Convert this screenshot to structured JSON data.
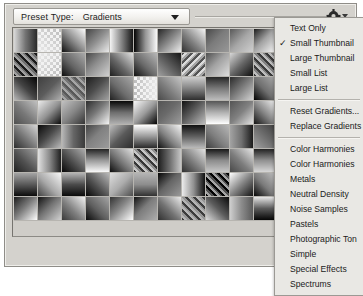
{
  "window": {
    "name": "preset-manager"
  },
  "header": {
    "preset_type_label": "Preset Type:",
    "preset_type_value": "Gradients",
    "dropdown_arrow_icon": "chevron-down-icon",
    "flyout_icon": "gear-icon"
  },
  "flyout_menu": {
    "groups": [
      {
        "items": [
          {
            "label": "Text Only",
            "checked": false
          },
          {
            "label": "Small Thumbnail",
            "checked": true
          },
          {
            "label": "Large Thumbnail",
            "checked": false
          },
          {
            "label": "Small List",
            "checked": false
          },
          {
            "label": "Large List",
            "checked": false
          }
        ]
      },
      {
        "items": [
          {
            "label": "Reset Gradients...",
            "checked": false
          },
          {
            "label": "Replace Gradients",
            "checked": false
          }
        ]
      },
      {
        "items": [
          {
            "label": "Color Harmonies",
            "checked": false
          },
          {
            "label": "Color Harmonies",
            "checked": false
          },
          {
            "label": "Metals",
            "checked": false
          },
          {
            "label": "Neutral Density",
            "checked": false
          },
          {
            "label": "Noise Samples",
            "checked": false
          },
          {
            "label": "Pastels",
            "checked": false
          },
          {
            "label": "Photographic Ton",
            "checked": false
          },
          {
            "label": "Simple",
            "checked": false
          },
          {
            "label": "Special Effects",
            "checked": false
          },
          {
            "label": "Spectrums",
            "checked": false
          }
        ]
      }
    ]
  },
  "swatch_panel": {
    "columns": 14,
    "rows": 8,
    "check_tooltip": "",
    "swatches": [
      "lin-0",
      "check-a",
      "lin-1",
      "lin-2",
      "lin-3",
      "lin-4",
      "diag-0",
      "diag-1",
      "diag-2",
      "lin-5",
      "diag-3",
      "diag-4",
      "diag-5",
      "diag-6",
      "stripe-0",
      "check-b",
      "diag-7",
      "diag-8",
      "diag-9",
      "diag-10",
      "lin-6",
      "stripe-1",
      "diag-11",
      "lin-7",
      "stripe-2",
      "diag-12",
      "diag-13",
      "lin-8",
      "lin-9",
      "lin-10",
      "stripe-3",
      "diag-14",
      "diag-15",
      "check-c",
      "diag-16",
      "lin-11",
      "lin-12",
      "diag-17",
      "diag-18",
      "check-d",
      "lin-13",
      "lin-14",
      "diag-19",
      "lin-15",
      "lin-16",
      "diag-20",
      "lin-17",
      "lin-18",
      "diag-21",
      "diag-22",
      "lin-19",
      "lin-20",
      "diag-23",
      "lin-21",
      "lin-22",
      "diag-24",
      "lin-23",
      "diag-25",
      "lin-24",
      "diag-26",
      "lin-25",
      "lin-26",
      "diag-27",
      "lin-27",
      "diag-28",
      "lin-28",
      "lin-29",
      "diag-29",
      "lin-30",
      "lin-31",
      "diag-30",
      "lin-32",
      "diag-31",
      "lin-33",
      "diag-32",
      "stripe-4",
      "lin-34",
      "diag-33",
      "lin-35",
      "diag-34",
      "lin-36",
      "lin-37",
      "diag-35",
      "lin-38",
      "lin-39",
      "diag-36",
      "lin-40",
      "diag-37",
      "lin-41",
      "lin-42",
      "diag-38",
      "lin-43",
      "stripe-5",
      "lin-44",
      "diag-39",
      "lin-45",
      "lin-46",
      "diag-40",
      "diag-41",
      "diag-42",
      "diag-43",
      "diag-44",
      "diag-45",
      "diag-46",
      "diag-47",
      "stripe-6",
      "lin-47",
      "lin-48",
      "lin-49",
      "lin-50",
      "lin-51",
      "lin-52"
    ]
  }
}
